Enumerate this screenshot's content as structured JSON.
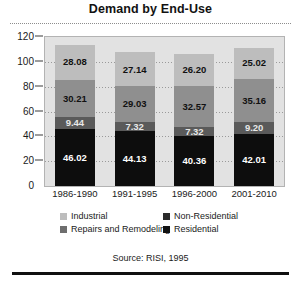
{
  "chart_data": {
    "type": "bar",
    "subtype": "stacked-vertical",
    "title": "Demand by End-Use",
    "xlabel": "",
    "ylabel": "",
    "ylim": [
      0,
      120
    ],
    "yticks": [
      0,
      20,
      40,
      60,
      80,
      100,
      120
    ],
    "grid": true,
    "grid_style": "dotted-horizontal",
    "legend_position": "below-plot",
    "categories": [
      "1986-1990",
      "1991-1995",
      "1996-2000",
      "2001-2010"
    ],
    "series": [
      {
        "name": "Residential",
        "color": "#0d0d0d",
        "values": [
          46.02,
          44.13,
          40.36,
          42.01
        ],
        "labels": [
          "46.02",
          "44.13",
          "40.36",
          "42.01"
        ]
      },
      {
        "name": "Repairs and Remodeling",
        "color": "#5a5a5a",
        "values": [
          9.44,
          7.32,
          7.32,
          9.2
        ],
        "labels": [
          "9.44",
          "7.32",
          "7.32",
          "9.20"
        ]
      },
      {
        "name": "Non-Residential",
        "color": "#8f8f8f",
        "values": [
          30.21,
          29.03,
          32.57,
          35.16
        ],
        "labels": [
          "30.21",
          "29.03",
          "32.57",
          "35.16"
        ]
      },
      {
        "name": "Industrial",
        "color": "#bdbdbd",
        "values": [
          28.08,
          27.14,
          26.2,
          25.02
        ],
        "labels": [
          "28.08",
          "27.14",
          "26.20",
          "25.02"
        ]
      }
    ],
    "totals": [
      113.75,
      107.62,
      106.45,
      111.39
    ],
    "source": "Source: RISI, 1995"
  },
  "legend": {
    "items": [
      {
        "label": "Industrial",
        "color": "#bdbdbd"
      },
      {
        "label": "Non-Residential",
        "color": "#2b2b2b"
      },
      {
        "label": "Repairs and Remodeling",
        "color": "#6e6e6e"
      },
      {
        "label": "Residential",
        "color": "#121212"
      }
    ]
  }
}
